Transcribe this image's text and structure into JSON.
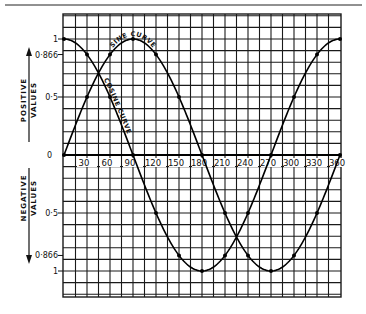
{
  "chart_data": {
    "type": "line",
    "title": "",
    "xlabel": "",
    "ylabel": "",
    "x_unit": "degrees",
    "xlim": [
      0,
      360
    ],
    "ylim": [
      -1.22,
      1.2
    ],
    "grid": true,
    "grid_step_x": 15,
    "grid_step_y": 0.1,
    "x_tick_labels": [
      "30",
      "60",
      "90",
      "120",
      "150",
      "180",
      "210",
      "240",
      "270",
      "300",
      "330",
      "360"
    ],
    "x_ticks": [
      30,
      60,
      90,
      120,
      150,
      180,
      210,
      240,
      270,
      300,
      330,
      360
    ],
    "origin_label": "0",
    "y_tick_labels_positive": [
      {
        "value": 1,
        "label": "1"
      },
      {
        "value": 0.866,
        "label": "0·866"
      },
      {
        "value": 0.5,
        "label": "0·5"
      }
    ],
    "y_tick_labels_negative": [
      {
        "value": -0.5,
        "label": "0·5"
      },
      {
        "value": -0.866,
        "label": "0·866"
      },
      {
        "value": -1,
        "label": "1"
      }
    ],
    "side_labels": {
      "positive": [
        "POSITIVE",
        "VALUES"
      ],
      "negative": [
        "NEGATIVE",
        "VALUES"
      ]
    },
    "x": [
      0,
      30,
      60,
      90,
      120,
      150,
      180,
      210,
      240,
      270,
      300,
      330,
      360
    ],
    "series": [
      {
        "name": "SINE CURVE",
        "values": [
          0,
          0.5,
          0.866,
          1,
          0.866,
          0.5,
          0,
          -0.5,
          -0.866,
          -1,
          -0.866,
          -0.5,
          0
        ]
      },
      {
        "name": "COSINE CURVE",
        "values": [
          1,
          0.866,
          0.5,
          0,
          -0.5,
          -0.866,
          -1,
          -0.866,
          -0.5,
          0,
          0.5,
          0.866,
          1
        ]
      }
    ],
    "legend": "none (curves labeled inline)"
  },
  "layout": {
    "plot_left": 64,
    "plot_right": 340,
    "grid_left": 63,
    "grid_right": 341,
    "grid_top": 14,
    "grid_bottom": 297,
    "zero_y": 155,
    "unit_px": 116,
    "ink": "#111111",
    "grid_color": "#1a1a1a",
    "background": "#ffffff"
  }
}
